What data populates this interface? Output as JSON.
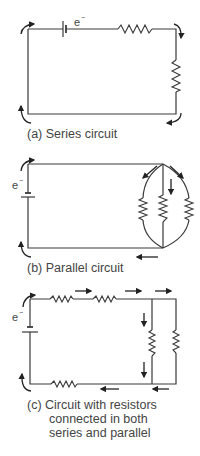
{
  "figure": {
    "panels": [
      {
        "id": "a",
        "label": "(a)  Series circuit",
        "label_lines": [
          "(a)  Series circuit"
        ],
        "electron_symbol": "e",
        "electron_charge": "−",
        "components": [
          "battery",
          "resistor-horizontal-top",
          "resistor-vertical-right"
        ],
        "flow_arrows": 4
      },
      {
        "id": "b",
        "label": "(b)  Parallel circuit",
        "label_lines": [
          "(b)  Parallel circuit"
        ],
        "electron_symbol": "e",
        "electron_charge": "−",
        "components": [
          "battery",
          "resistor-parallel-left",
          "resistor-parallel-middle",
          "resistor-parallel-right"
        ],
        "flow_arrows": 5
      },
      {
        "id": "c",
        "label": "(c)  Circuit with resistors connected in both series and parallel",
        "label_lines": [
          "(c)  Circuit with resistors",
          "connected in both",
          "series and parallel"
        ],
        "electron_symbol": "e",
        "electron_charge": "−",
        "components": [
          "battery",
          "resistor-top-1",
          "resistor-top-2",
          "resistor-bottom",
          "resistor-parallel-middle",
          "resistor-parallel-right"
        ],
        "flow_arrows": 9
      }
    ],
    "colors": {
      "line": "#3a3a3a",
      "arrow": "#222222",
      "text": "#444444",
      "background": "#ffffff"
    }
  }
}
